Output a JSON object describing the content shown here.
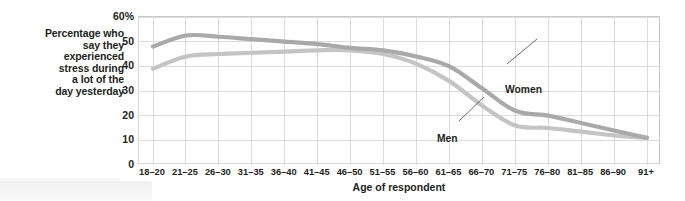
{
  "chart_data": {
    "type": "line",
    "title": "",
    "subtitle": "",
    "xlabel": "Age of respondent",
    "ylabel": "Percentage who say they experienced stress during a lot of the day yesterday",
    "ylabel_lines": [
      "Percentage who",
      "say they",
      "experienced",
      "stress during",
      "a lot of the",
      "day yesterday"
    ],
    "categories": [
      "18–20",
      "21–25",
      "26–30",
      "31–35",
      "36–40",
      "41–45",
      "46–50",
      "51–55",
      "56–60",
      "61–65",
      "66–70",
      "71–75",
      "76–80",
      "81–85",
      "86–90",
      "91+"
    ],
    "ytick_labels": [
      "60%",
      "50",
      "40",
      "30",
      "20",
      "10",
      "0"
    ],
    "ytick_values": [
      60,
      50,
      40,
      30,
      20,
      10,
      0
    ],
    "ylim": [
      0,
      60
    ],
    "grid": true,
    "legend_position": "inline-annotation",
    "series": [
      {
        "name": "Women",
        "color": "#a9a9a9",
        "values": [
          48,
          52.5,
          52,
          51,
          50,
          49,
          47.5,
          46.5,
          44,
          40,
          31,
          22,
          20,
          17,
          14,
          11
        ]
      },
      {
        "name": "Men",
        "color": "#c4c4c4",
        "values": [
          39,
          44,
          45,
          45.5,
          46,
          46.5,
          46.5,
          45,
          41,
          34,
          24,
          16,
          15,
          13.5,
          12,
          11
        ]
      }
    ],
    "annotations": [
      {
        "text": "Women",
        "series": "Women",
        "anchor_category": "66–70"
      },
      {
        "text": "Men",
        "series": "Men",
        "anchor_category": "66–70"
      }
    ],
    "colors": {
      "women_line": "#a9a9a9",
      "men_line": "#c4c4c4",
      "grid": "#dcdcdc",
      "frame": "#c9c9c9",
      "text": "#231f20",
      "background": "#ffffff"
    }
  }
}
